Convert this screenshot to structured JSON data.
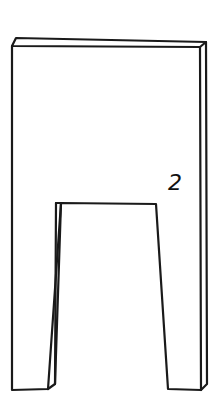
{
  "diagram": {
    "part_label": "2",
    "stroke_color": "#1a1a1a",
    "background": "#ffffff"
  }
}
